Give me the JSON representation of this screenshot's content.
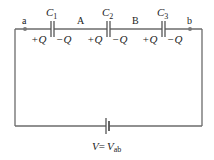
{
  "diagram": {
    "type": "series-capacitor-circuit",
    "nodes": {
      "a": "a",
      "A": "A",
      "B": "B",
      "b": "b"
    },
    "capacitors": [
      {
        "name": "C",
        "sub": "1",
        "left_charge": "+Q",
        "right_charge": "−Q"
      },
      {
        "name": "C",
        "sub": "2",
        "left_charge": "+Q",
        "right_charge": "−Q"
      },
      {
        "name": "C",
        "sub": "3",
        "left_charge": "+Q",
        "right_charge": "−Q"
      }
    ],
    "source": {
      "label_v": "V",
      "label_eq": "=",
      "label_vab": "V",
      "label_vab_sub": "ab"
    },
    "colors": {
      "wire": "#6b6b6b",
      "node": "#7a7a7a",
      "text": "#222222"
    }
  }
}
